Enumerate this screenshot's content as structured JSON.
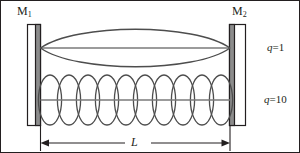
{
  "figure": {
    "type": "optical-cavity-standing-wave-diagram",
    "border_color": "#231f20",
    "background_color": "#ffffff"
  },
  "mirrors": {
    "left": {
      "name": "M",
      "subscript": "1",
      "body_color": "#ffffff",
      "coating_color": "#8c8c8c",
      "outline_color": "#231f20"
    },
    "right": {
      "name": "M",
      "subscript": "2",
      "body_color": "#ffffff",
      "coating_color": "#8c8c8c",
      "outline_color": "#231f20"
    }
  },
  "modes": [
    {
      "id": "mode-q1",
      "symbol": "q",
      "equals": "=",
      "order": "1",
      "label": "q=1",
      "lobes": 1,
      "axis_y": 47,
      "amplitude": 22,
      "curve_color": "#4d4d4d",
      "axis_color": "#7a7a7a"
    },
    {
      "id": "mode-q10",
      "symbol": "q",
      "equals": "=",
      "order": "10",
      "label": "q=10",
      "lobes": 10,
      "axis_y": 99,
      "amplitude": 25,
      "curve_color": "#4d4d4d",
      "axis_color": "#7a7a7a"
    }
  ],
  "dimension": {
    "label": "L",
    "description": "cavity length between mirror surfaces",
    "arrow_color": "#231f20",
    "y": 142
  }
}
